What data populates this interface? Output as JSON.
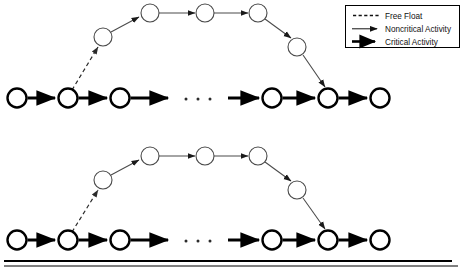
{
  "figure": {
    "title": "",
    "type": "network-diagram"
  },
  "legend": {
    "name": "legend-box",
    "border_color": "#000000",
    "items": [
      {
        "key": "free-float",
        "label": "Free Float",
        "style": "dashed",
        "line_width": 1.1,
        "color": "#1a1a1a",
        "arrow": false
      },
      {
        "key": "noncritical-activity",
        "label": "Noncritical Activity",
        "style": "solid-thin",
        "line_width": 1.0,
        "color": "#1a1a1a",
        "arrow": true
      },
      {
        "key": "critical-activity",
        "label": "Critical Activity",
        "style": "solid-thick",
        "line_width": 3.0,
        "color": "#000000",
        "arrow": true
      }
    ]
  },
  "colors": {
    "critical": "#000000",
    "noncritical": "#4a4a4a",
    "free_float": "#2a2a2a",
    "node_fill": "#ffffff",
    "node_stroke_critical": "#000000",
    "node_stroke_noncritical": "#4a4a4a",
    "rule": "#000000"
  },
  "ellipsis": {
    "label": "• • •",
    "dots": 3
  },
  "diagrams": [
    {
      "id": "diagram-top",
      "name": "network-diagram-top",
      "critical_nodes": [
        {
          "id": "c1",
          "cx": 17,
          "cy": 98,
          "r": 9.5
        },
        {
          "id": "c2",
          "cx": 68,
          "cy": 98,
          "r": 9.5
        },
        {
          "id": "c3",
          "cx": 120,
          "cy": 98,
          "r": 9.5
        },
        {
          "id": "c4",
          "cx": 272,
          "cy": 98,
          "r": 9.5
        },
        {
          "id": "c5",
          "cx": 328,
          "cy": 98,
          "r": 9.5
        },
        {
          "id": "c6",
          "cx": 380,
          "cy": 98,
          "r": 9.5
        }
      ],
      "noncritical_nodes": [
        {
          "id": "n1",
          "cx": 103,
          "cy": 37,
          "r": 9.0
        },
        {
          "id": "n2",
          "cx": 150,
          "cy": 13,
          "r": 9.0
        },
        {
          "id": "n3",
          "cx": 205,
          "cy": 13,
          "r": 9.0
        },
        {
          "id": "n4",
          "cx": 258,
          "cy": 13,
          "r": 9.0
        },
        {
          "id": "n5",
          "cx": 297,
          "cy": 47,
          "r": 9.0
        }
      ],
      "ellipsis_at": {
        "x": 196,
        "y": 99
      }
    },
    {
      "id": "diagram-bottom",
      "name": "network-diagram-bottom",
      "critical_nodes": [
        {
          "id": "c1",
          "cx": 17,
          "cy": 240,
          "r": 9.5
        },
        {
          "id": "c2",
          "cx": 68,
          "cy": 240,
          "r": 9.5
        },
        {
          "id": "c3",
          "cx": 120,
          "cy": 240,
          "r": 9.5
        },
        {
          "id": "c4",
          "cx": 272,
          "cy": 240,
          "r": 9.5
        },
        {
          "id": "c5",
          "cx": 328,
          "cy": 240,
          "r": 9.5
        },
        {
          "id": "c6",
          "cx": 380,
          "cy": 240,
          "r": 9.5
        }
      ],
      "noncritical_nodes": [
        {
          "id": "n1",
          "cx": 103,
          "cy": 180,
          "r": 9.0
        },
        {
          "id": "n2",
          "cx": 150,
          "cy": 156,
          "r": 9.0
        },
        {
          "id": "n3",
          "cx": 205,
          "cy": 156,
          "r": 9.0
        },
        {
          "id": "n4",
          "cx": 258,
          "cy": 156,
          "r": 9.0
        },
        {
          "id": "n5",
          "cx": 297,
          "cy": 190,
          "r": 9.0
        }
      ],
      "ellipsis_at": {
        "x": 196,
        "y": 241
      }
    }
  ],
  "rules": [
    {
      "name": "bottom-rule-upper",
      "x1": 4,
      "y1": 261,
      "x2": 452,
      "y2": 261,
      "width": 2.2
    },
    {
      "name": "bottom-rule-lower",
      "x1": 4,
      "y1": 266,
      "x2": 458,
      "y2": 266,
      "width": 1.0
    }
  ]
}
